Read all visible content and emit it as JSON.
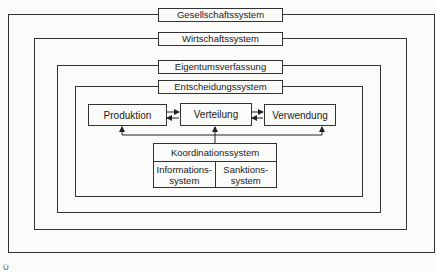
{
  "diagram": {
    "layers": [
      {
        "label": "Gesellschaftssystem"
      },
      {
        "label": "Wirtschaftssystem"
      },
      {
        "label": "Eigentumsverfassung"
      },
      {
        "label": "Entscheidungssystem"
      }
    ],
    "processes": [
      {
        "label": "Produktion"
      },
      {
        "label": "Verteilung"
      },
      {
        "label": "Verwendung"
      }
    ],
    "coordination": {
      "title": "Koordinationssystem",
      "parts": [
        {
          "label": "Informations-\nsystem"
        },
        {
          "label": "Sanktions-\nsystem"
        }
      ]
    },
    "corner_mark": "Ü"
  }
}
